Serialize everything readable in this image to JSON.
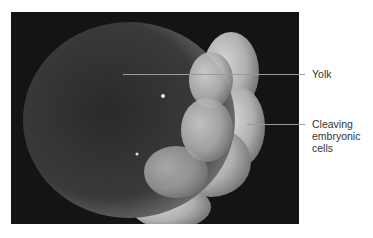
{
  "figure": {
    "labels": [
      {
        "id": "yolk",
        "text": "Yolk"
      },
      {
        "id": "cleaving",
        "lines": [
          "Cleaving",
          "embryonic",
          "cells"
        ]
      }
    ],
    "colors": {
      "background": "#141414",
      "leader_line": "#9a9a9a",
      "label_text": "#333333"
    }
  }
}
